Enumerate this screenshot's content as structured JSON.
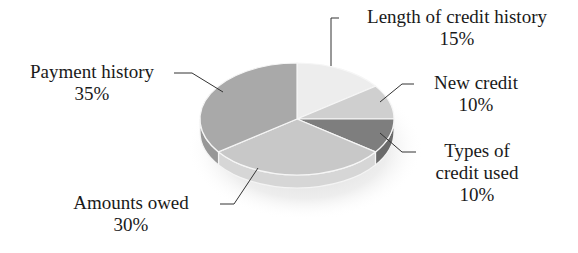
{
  "chart_data": {
    "type": "pie",
    "style": "3d",
    "title": "",
    "start_angle": "12 o'clock",
    "direction": "clockwise",
    "categories": [
      "Length of credit history",
      "New credit",
      "Types of credit used",
      "Amounts owed",
      "Payment history"
    ],
    "values": [
      15,
      10,
      10,
      30,
      35
    ],
    "unit": "%",
    "colors": [
      "#ededed",
      "#cfcfcf",
      "#7e7e7e",
      "#c8c8c8",
      "#a9a9a9"
    ],
    "side_colors": [
      "#dcdcdc",
      "#bdbdbd",
      "#6a6a6a",
      "#d6d6d6",
      "#979797"
    ],
    "legend": "none (leader-line labels)",
    "labels": [
      {
        "name": "Length of credit history",
        "value": "15%"
      },
      {
        "name": "New credit",
        "value": "10%"
      },
      {
        "name": "Types of credit used",
        "value": "10%"
      },
      {
        "name": "Amounts owed",
        "value": "30%"
      },
      {
        "name": "Payment history",
        "value": "35%"
      }
    ]
  },
  "labels": {
    "length": {
      "line1": "Length of credit history",
      "line2": "15%"
    },
    "new": {
      "line1": "New credit",
      "line2": "10%"
    },
    "types": {
      "line1": "Types of",
      "line2": "credit used",
      "line3": "10%"
    },
    "amounts": {
      "line1": "Amounts owed",
      "line2": "30%"
    },
    "payment": {
      "line1": "Payment history",
      "line2": "35%"
    }
  }
}
